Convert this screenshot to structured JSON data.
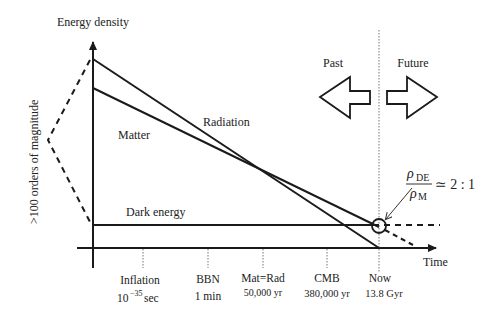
{
  "axes": {
    "y_label": "Energy density",
    "x_label": "Time",
    "magnitude_label": ">100  orders of magnitude"
  },
  "curves": {
    "radiation": "Radiation",
    "matter": "Matter",
    "dark_energy": "Dark energy"
  },
  "direction": {
    "past": "Past",
    "future": "Future"
  },
  "ratio": {
    "numerator_symbol": "ρ",
    "numerator_sub": "DE",
    "denominator_symbol": "ρ",
    "denominator_sub": "M",
    "value": "≃ 2 : 1"
  },
  "ticks": [
    {
      "label": "Inflation",
      "sub": "10",
      "sup": "−35",
      "unit": "sec"
    },
    {
      "label": "BBN",
      "sub": "1 min"
    },
    {
      "label": "Mat=Rad",
      "sub": "50,000 yr"
    },
    {
      "label": "CMB",
      "sub": "380,000 yr"
    },
    {
      "label": "Now",
      "sub": "13.8 Gyr"
    }
  ],
  "colors": {
    "line": "#1a1a1a",
    "text": "#222222",
    "dotted": "#777777",
    "background": "#ffffff"
  }
}
